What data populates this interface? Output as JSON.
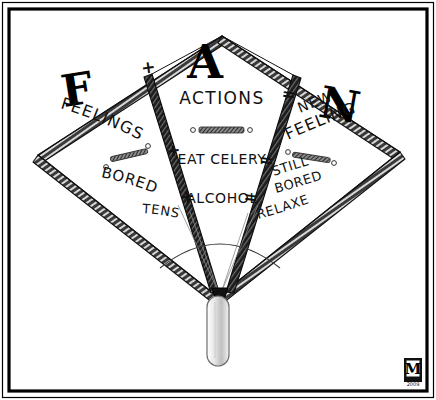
{
  "artwork": {
    "title": "FAN diagram cartoon",
    "medium": "black and white pen illustration",
    "background_color": "#ffffff",
    "ink_color": "#111111",
    "frame": {
      "outer_color": "#000000",
      "inner_color": "#ffffff"
    }
  },
  "acronym": {
    "letters": [
      "F",
      "A",
      "N"
    ]
  },
  "panels": {
    "left": {
      "letter": "F",
      "heading": "FEELINGS",
      "items": [
        "BORED",
        "TENSE"
      ]
    },
    "center": {
      "letter": "A",
      "heading": "ACTIONS",
      "items": [
        "EAT CELERY",
        "ALCOHOL"
      ]
    },
    "right": {
      "letter": "N",
      "heading_line1": "NEW",
      "heading_line2": "FEELINGS",
      "items_line1": "STILL",
      "items_line2": "BORED",
      "items_line3": "RELAXED"
    }
  },
  "operators": {
    "plus": [
      "+",
      "+",
      "+"
    ],
    "equals": [
      "=",
      "=",
      "="
    ]
  },
  "signature": {
    "monogram": "M",
    "year": "2009"
  }
}
